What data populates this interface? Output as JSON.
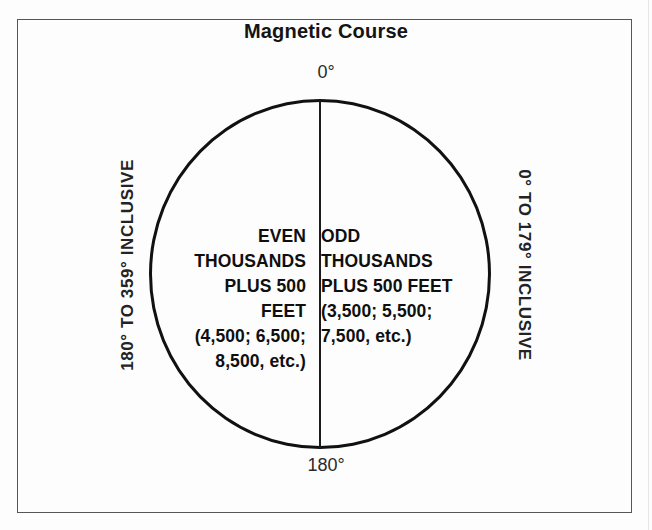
{
  "figure": {
    "title": "Magnetic Course",
    "label_top": "0°",
    "label_bottom": "180°",
    "side_label_left": "180° TO 359° INCLUSIVE",
    "side_label_right": "0° TO 179° INCLUSIVE",
    "left_half": {
      "lines": [
        "EVEN",
        "THOUSANDS",
        "PLUS 500",
        "FEET",
        "(4,500; 6,500;",
        "8,500, etc.)"
      ],
      "text": "EVEN\nTHOUSANDS\nPLUS 500\nFEET\n(4,500; 6,500;\n8,500, etc.)"
    },
    "right_half": {
      "lines": [
        "ODD",
        "THOUSANDS",
        "PLUS 500 FEET",
        "(3,500; 5,500;",
        "7,500, etc.)"
      ],
      "text": "ODD\nTHOUSANDS\nPLUS 500 FEET\n(3,500; 5,500;\n7,500, etc.)"
    },
    "colors": {
      "background": "#fdfdfd",
      "frame_border": "#55565a",
      "ellipse_stroke": "#111111",
      "divider": "#1b1b1b",
      "text": "#0f0f0f"
    }
  }
}
